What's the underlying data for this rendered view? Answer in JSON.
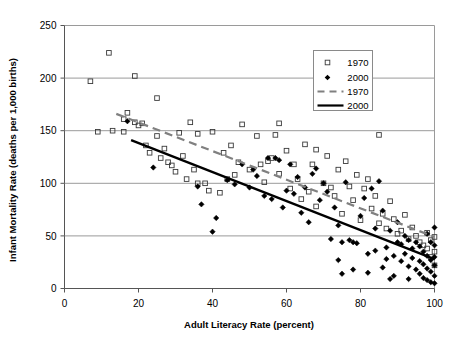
{
  "chart_data": {
    "type": "scatter",
    "title": "",
    "xlabel": "Adult Literacy Rate (percent)",
    "ylabel": "Infant Mortality Rate (deaths per 1,000 births)",
    "xlim": [
      0,
      100
    ],
    "ylim": [
      0,
      250
    ],
    "xticks": [
      0,
      20,
      40,
      60,
      80,
      100
    ],
    "yticks": [
      0,
      50,
      100,
      150,
      200,
      250
    ],
    "xtick_labels": [
      "0",
      "20",
      "40",
      "60",
      "80",
      "100"
    ],
    "ytick_labels": [
      "0",
      "50",
      "100",
      "150",
      "200",
      "250"
    ],
    "grid": "horizontal",
    "legend_position": "top-right",
    "legend": [
      {
        "label": "1970",
        "kind": "marker",
        "marker": "open-square",
        "color": "#000000"
      },
      {
        "label": "2000",
        "kind": "marker",
        "marker": "filled-diamond",
        "color": "#000000"
      },
      {
        "label": "1970",
        "kind": "line",
        "style": "dashed",
        "color": "#808080"
      },
      {
        "label": "2000",
        "kind": "line",
        "style": "solid",
        "color": "#000000"
      }
    ],
    "series": [
      {
        "name": "1970",
        "marker": "open-square",
        "points": [
          [
            7,
            197
          ],
          [
            12,
            224
          ],
          [
            9,
            149
          ],
          [
            13,
            150
          ],
          [
            16,
            149
          ],
          [
            16,
            161
          ],
          [
            17,
            167
          ],
          [
            19,
            202
          ],
          [
            19,
            158
          ],
          [
            20,
            155
          ],
          [
            21,
            157
          ],
          [
            22,
            136
          ],
          [
            23,
            129
          ],
          [
            25,
            181
          ],
          [
            25,
            145
          ],
          [
            26,
            124
          ],
          [
            27,
            133
          ],
          [
            28,
            120
          ],
          [
            29,
            117
          ],
          [
            30,
            111
          ],
          [
            31,
            148
          ],
          [
            32,
            126
          ],
          [
            33,
            104
          ],
          [
            34,
            158
          ],
          [
            35,
            113
          ],
          [
            36,
            100
          ],
          [
            36,
            147
          ],
          [
            38,
            100
          ],
          [
            39,
            93
          ],
          [
            40,
            149
          ],
          [
            42,
            91
          ],
          [
            43,
            129
          ],
          [
            44,
            104
          ],
          [
            45,
            136
          ],
          [
            46,
            108
          ],
          [
            47,
            120
          ],
          [
            48,
            156
          ],
          [
            50,
            113
          ],
          [
            52,
            145
          ],
          [
            53,
            118
          ],
          [
            54,
            101
          ],
          [
            55,
            121
          ],
          [
            56,
            124
          ],
          [
            57,
            146
          ],
          [
            58,
            157
          ],
          [
            58,
            109
          ],
          [
            60,
            131
          ],
          [
            61,
            95
          ],
          [
            62,
            118
          ],
          [
            63,
            104
          ],
          [
            64,
            85
          ],
          [
            65,
            137
          ],
          [
            66,
            92
          ],
          [
            67,
            118
          ],
          [
            68,
            132
          ],
          [
            68,
            78
          ],
          [
            70,
            100
          ],
          [
            71,
            126
          ],
          [
            72,
            96
          ],
          [
            73,
            88
          ],
          [
            74,
            113
          ],
          [
            75,
            71
          ],
          [
            76,
            121
          ],
          [
            77,
            97
          ],
          [
            78,
            84
          ],
          [
            79,
            108
          ],
          [
            80,
            65
          ],
          [
            81,
            95
          ],
          [
            82,
            104
          ],
          [
            83,
            76
          ],
          [
            84,
            88
          ],
          [
            85,
            146
          ],
          [
            85,
            62
          ],
          [
            86,
            71
          ],
          [
            87,
            57
          ],
          [
            88,
            83
          ],
          [
            89,
            66
          ],
          [
            90,
            52
          ],
          [
            91,
            55
          ],
          [
            92,
            70
          ],
          [
            93,
            47
          ],
          [
            94,
            58
          ],
          [
            95,
            50
          ],
          [
            96,
            44
          ],
          [
            97,
            41
          ],
          [
            98,
            53
          ],
          [
            98,
            38
          ],
          [
            99,
            46
          ],
          [
            99,
            30
          ],
          [
            100,
            35
          ],
          [
            100,
            22
          ],
          [
            100,
            49
          ]
        ]
      },
      {
        "name": "2000",
        "marker": "filled-diamond",
        "points": [
          [
            17,
            159
          ],
          [
            24,
            115
          ],
          [
            36,
            97
          ],
          [
            37,
            80
          ],
          [
            40,
            54
          ],
          [
            41,
            67
          ],
          [
            44,
            103
          ],
          [
            46,
            99
          ],
          [
            48,
            118
          ],
          [
            50,
            96
          ],
          [
            51,
            113
          ],
          [
            52,
            107
          ],
          [
            54,
            88
          ],
          [
            55,
            124
          ],
          [
            56,
            85
          ],
          [
            57,
            124
          ],
          [
            58,
            122
          ],
          [
            59,
            77
          ],
          [
            60,
            93
          ],
          [
            61,
            118
          ],
          [
            62,
            90
          ],
          [
            63,
            106
          ],
          [
            64,
            72
          ],
          [
            65,
            96
          ],
          [
            66,
            63
          ],
          [
            67,
            109
          ],
          [
            68,
            114
          ],
          [
            69,
            84
          ],
          [
            70,
            100
          ],
          [
            71,
            92
          ],
          [
            72,
            47
          ],
          [
            73,
            77
          ],
          [
            74,
            60
          ],
          [
            75,
            44
          ],
          [
            76,
            101
          ],
          [
            77,
            46
          ],
          [
            78,
            44
          ],
          [
            79,
            43
          ],
          [
            80,
            69
          ],
          [
            81,
            86
          ],
          [
            82,
            33
          ],
          [
            83,
            95
          ],
          [
            84,
            57
          ],
          [
            84,
            36
          ],
          [
            85,
            102
          ],
          [
            86,
            74
          ],
          [
            87,
            39
          ],
          [
            87,
            28
          ],
          [
            88,
            55
          ],
          [
            89,
            31
          ],
          [
            90,
            63
          ],
          [
            90,
            44
          ],
          [
            91,
            42
          ],
          [
            91,
            26
          ],
          [
            92,
            50
          ],
          [
            92,
            33
          ],
          [
            93,
            46
          ],
          [
            93,
            21
          ],
          [
            94,
            38
          ],
          [
            94,
            29
          ],
          [
            95,
            44
          ],
          [
            95,
            18
          ],
          [
            96,
            40
          ],
          [
            96,
            26
          ],
          [
            96,
            14
          ],
          [
            97,
            35
          ],
          [
            97,
            23
          ],
          [
            97,
            10
          ],
          [
            98,
            52
          ],
          [
            98,
            31
          ],
          [
            98,
            19
          ],
          [
            98,
            8
          ],
          [
            99,
            44
          ],
          [
            99,
            27
          ],
          [
            99,
            16
          ],
          [
            99,
            6
          ],
          [
            100,
            58
          ],
          [
            100,
            41
          ],
          [
            100,
            30
          ],
          [
            100,
            22
          ],
          [
            100,
            12
          ],
          [
            100,
            5
          ],
          [
            93,
            9
          ],
          [
            89,
            12
          ],
          [
            86,
            20
          ],
          [
            82,
            15
          ],
          [
            78,
            18
          ],
          [
            75,
            14
          ],
          [
            74,
            27
          ],
          [
            88,
            9
          ]
        ]
      }
    ],
    "trendlines": [
      {
        "name": "1970",
        "style": "dashed",
        "color": "#808080",
        "x1": 14,
        "y1": 166,
        "x2": 100,
        "y2": 49
      },
      {
        "name": "2000",
        "style": "solid",
        "color": "#000000",
        "x1": 18,
        "y1": 141,
        "x2": 100,
        "y2": 28
      }
    ]
  }
}
